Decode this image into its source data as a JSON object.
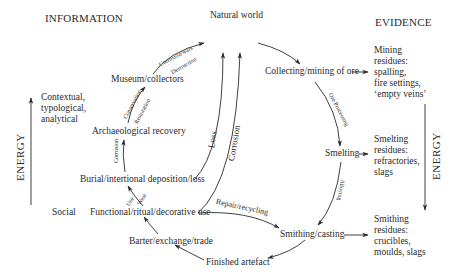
{
  "headers": {
    "information": "INFORMATION",
    "evidence": "EVIDENCE"
  },
  "energy": {
    "left_label": "ENERGY",
    "left_direction": "up",
    "right_label": "ENERGY",
    "right_direction": "down"
  },
  "side_labels": {
    "contextual": [
      "Contextual,",
      "typological,",
      "analytical"
    ],
    "social": "Social"
  },
  "nodes": {
    "natural_world": "Natural world",
    "collecting_mining": "Collecting/mining of ore",
    "smelting": "Smelting",
    "smithing_casting": "Smithing/casting",
    "finished_artefact": "Finished artefact",
    "barter": "Barter/exchange/trade",
    "functional_use": "Functional/ritual/decorative use",
    "burial": "Burial/intertional deposition/loss",
    "archaeological_recovery": "Archaeological recovery",
    "museum_collectors": "Museum/collectors"
  },
  "evidence_items": {
    "mining": [
      "Mining",
      "residues:",
      "spalling,",
      "fire settings,",
      "‘empty veins’"
    ],
    "smelting": [
      "Smelting",
      "residues:",
      "refractories,",
      "slags"
    ],
    "smithing": [
      "Smithing",
      "residues:",
      "crucibles,",
      "moulds, slags"
    ]
  },
  "edge_labels": {
    "corrosion_wars": "Corrosion/wars",
    "destruction": "Destruction",
    "conservation": "Conservation",
    "restoration": "Restoration",
    "corrosion_burial": "Corrosion",
    "use": "Use",
    "wear": "Wear",
    "loss": "Loss",
    "corrosion_main": "Corrosion",
    "repair_recycling": "Repair/recycling",
    "ore_processing": "Ore Processing",
    "alloying": "Alloying"
  }
}
